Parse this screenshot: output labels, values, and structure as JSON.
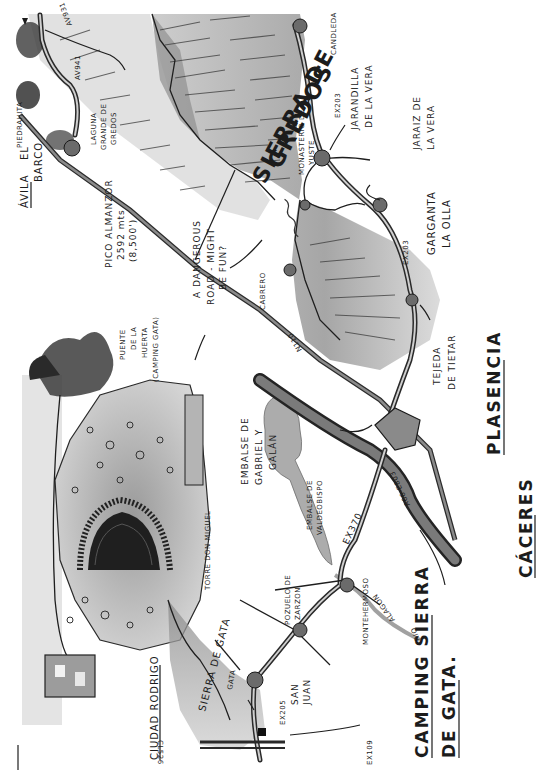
{
  "map": {
    "title": "Sierra de Gredos",
    "orientation": "rotated 90 degrees, text reads bottom-to-top",
    "style": "hand-drawn pencil and ink sketch, greyscale",
    "mountain_ranges": {
      "gredos_line1": "SIERRA DE",
      "gredos_line2": "GREDOS",
      "gata": "SIERRA DE GATA"
    },
    "towns": {
      "avila": "ÁVILA",
      "el_barco_1": "EL",
      "el_barco_2": "BARCO",
      "piedrahita": "PIEDRAHITA",
      "candeleda": "CANDLEDA",
      "jarandilla_1": "JARANDILLA",
      "jarandilla_2": "DE LA VERA",
      "jaraiz_1": "JARAIZ DE",
      "jaraiz_2": "LA VERA",
      "monasterio_1": "MONASTERIO DE",
      "monasterio_2": "YUSTE",
      "garganta_1": "GARGANTA",
      "garganta_2": "LA OLLA",
      "tejeda_1": "TEJEDA",
      "tejeda_2": "DE TIETAR",
      "plasencia": "PLASENCIA",
      "caceres": "CÁCERES",
      "cabrero": "CABRERO",
      "montehermoso": "MONTEHERMOSO",
      "pozuelo_1": "POZUELO DE",
      "pozuelo_2": "ZARZON",
      "gata": "GATA",
      "san_juan_1": "SAN",
      "san_juan_2": "JUAN",
      "torre": "TORRE DON MIGUEL",
      "ciudad_rodrigo": "CIUDAD RODRIGO"
    },
    "roads": {
      "av931": "AV931",
      "av941": "AV941",
      "ex203_a": "EX203",
      "ex203_b": "EX203",
      "n110": "N110",
      "ex370": "EX370",
      "a66": "A66-E803",
      "ex205": "EX205",
      "ex109": "EX109",
      "cl526": "CL526"
    },
    "water": {
      "laguna_1": "LAGUNA",
      "laguna_2": "GRANDE DE",
      "laguna_3": "GREDOS",
      "embalse_gg_1": "EMBALSE DE",
      "embalse_gg_2": "GABRIEL Y",
      "embalse_gg_3": "GALÁN",
      "embalse_v_1": "EMBALSE DE",
      "embalse_v_2": "VALDEOBISPO",
      "rio_1": "RIO",
      "rio_2": "ALAGON"
    },
    "annotations": {
      "pico_1": "PICO ALMANZOR",
      "pico_2": "2592 mts",
      "pico_3": "(8,500')",
      "dangerous_1": "A DANGEROUS",
      "dangerous_2": "ROAD - MIGHT",
      "dangerous_3": "BE FUN?",
      "puente_1": "PUENTE",
      "puente_2": "DE LA",
      "puente_3": "HUERTA",
      "puente_4": "(CAMPING GATA)",
      "camping_1": "CAMPING SIERRA",
      "camping_2": "DE GATA."
    },
    "colors": {
      "ink": "#1c1c1c",
      "shade_dark": "#5a5a5a",
      "shade_mid": "#9a9a9a",
      "shade_light": "#d4d4d4",
      "paper": "#ffffff"
    }
  }
}
